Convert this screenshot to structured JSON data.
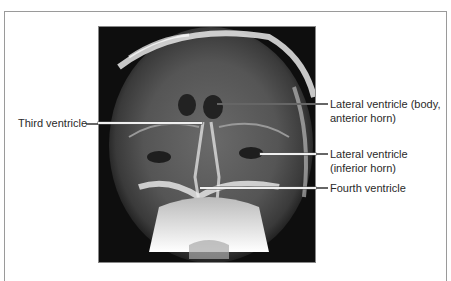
{
  "figure": {
    "image_alt": "Frontal radiograph of skull showing ventricles",
    "labels": [
      {
        "id": "lateral-body",
        "line1": "Lateral ventricle (body,",
        "line2": "anterior horn)"
      },
      {
        "id": "third",
        "line1": "Third ventricle",
        "line2": ""
      },
      {
        "id": "lateral-inferior",
        "line1": "Lateral ventricle",
        "line2": "(inferior horn)"
      },
      {
        "id": "fourth",
        "line1": "Fourth ventricle",
        "line2": ""
      }
    ]
  }
}
